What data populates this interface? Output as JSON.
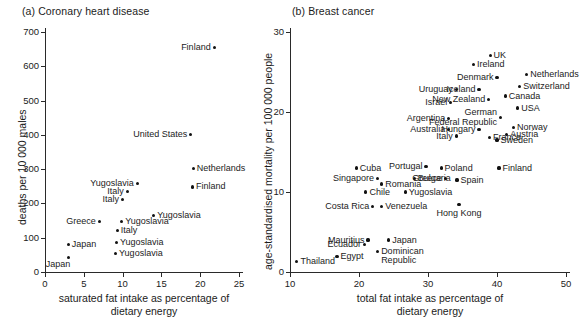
{
  "figure": {
    "panel_a_title": "(a) Coronary heart disease",
    "panel_b_title": "(b) Breast cancer"
  },
  "chart_data": [
    {
      "type": "scatter",
      "title": "(a) Coronary heart disease",
      "xlabel": "saturated fat intake as percentage of\ndietary energy",
      "ylabel": "deaths per 10 000 males",
      "xlim": [
        0,
        25
      ],
      "ylim": [
        0,
        700
      ],
      "xticks": [
        0,
        5,
        10,
        15,
        20,
        25
      ],
      "yticks": [
        0,
        100,
        200,
        300,
        400,
        500,
        600,
        700
      ],
      "grid": false,
      "legend": "none",
      "points": [
        {
          "label": "Finland",
          "x": 21.8,
          "y": 655,
          "lpos": "l"
        },
        {
          "label": "United States",
          "x": 18.8,
          "y": 400,
          "lpos": "l"
        },
        {
          "label": "Netherlands",
          "x": 19.1,
          "y": 302,
          "lpos": "r"
        },
        {
          "label": "Finland",
          "x": 19.0,
          "y": 248,
          "lpos": "r"
        },
        {
          "label": "Yugoslavia",
          "x": 11.9,
          "y": 258,
          "lpos": "l"
        },
        {
          "label": "Italy",
          "x": 10.6,
          "y": 235,
          "lpos": "l"
        },
        {
          "label": "Italy",
          "x": 10.0,
          "y": 211,
          "lpos": "l"
        },
        {
          "label": "Yugoslavia",
          "x": 14.0,
          "y": 165,
          "lpos": "r"
        },
        {
          "label": "Greece",
          "x": 7.0,
          "y": 148,
          "lpos": "l"
        },
        {
          "label": "Yugoslavia",
          "x": 9.9,
          "y": 147,
          "lpos": "r"
        },
        {
          "label": "Italy",
          "x": 9.3,
          "y": 121,
          "lpos": "r"
        },
        {
          "label": "Japan",
          "x": 3.0,
          "y": 80,
          "lpos": "r"
        },
        {
          "label": "Yugoslavia",
          "x": 9.2,
          "y": 87,
          "lpos": "r"
        },
        {
          "label": "Yugoslavia",
          "x": 9.1,
          "y": 55,
          "lpos": "r"
        },
        {
          "label": "Japan",
          "x": 3.0,
          "y": 43,
          "lpos": "bl"
        }
      ]
    },
    {
      "type": "scatter",
      "title": "(b) Breast cancer",
      "xlabel": "total fat intake as percentage of\ndietary energy",
      "ylabel": "age-standardised mortality per 100 000 people",
      "xlim": [
        10,
        50
      ],
      "ylim": [
        0,
        30
      ],
      "xticks": [
        10,
        20,
        30,
        40,
        50
      ],
      "yticks": [
        0,
        10,
        20,
        30
      ],
      "grid": false,
      "legend": "none",
      "points": [
        {
          "label": "UK",
          "x": 39.0,
          "y": 27.1,
          "lpos": "r"
        },
        {
          "label": "Ireland",
          "x": 36.6,
          "y": 25.9,
          "lpos": "r"
        },
        {
          "label": "Netherlands",
          "x": 44.3,
          "y": 24.7,
          "lpos": "r"
        },
        {
          "label": "Denmark",
          "x": 40.0,
          "y": 24.3,
          "lpos": "l"
        },
        {
          "label": "Switzerland",
          "x": 43.3,
          "y": 23.2,
          "lpos": "r"
        },
        {
          "label": "Uruguay",
          "x": 34.1,
          "y": 22.8,
          "lpos": "l"
        },
        {
          "label": "Iceland",
          "x": 37.4,
          "y": 22.8,
          "lpos": "l"
        },
        {
          "label": "Canada",
          "x": 41.2,
          "y": 22.0,
          "lpos": "r"
        },
        {
          "label": "New Zealand",
          "x": 38.8,
          "y": 21.6,
          "lpos": "l"
        },
        {
          "label": "Israel",
          "x": 33.3,
          "y": 21.2,
          "lpos": "l"
        },
        {
          "label": "USA",
          "x": 43.0,
          "y": 20.5,
          "lpos": "r"
        },
        {
          "label": "German\nFederal Republic",
          "x": 40.5,
          "y": 19.3,
          "lpos": "l"
        },
        {
          "label": "Argentina",
          "x": 33.0,
          "y": 19.2,
          "lpos": "l"
        },
        {
          "label": "Norway",
          "x": 42.4,
          "y": 18.1,
          "lpos": "r"
        },
        {
          "label": "Australia",
          "x": 33.0,
          "y": 17.8,
          "lpos": "l"
        },
        {
          "label": "Hungary",
          "x": 37.4,
          "y": 17.8,
          "lpos": "l"
        },
        {
          "label": "Austria",
          "x": 41.4,
          "y": 17.2,
          "lpos": "r"
        },
        {
          "label": "Italy",
          "x": 34.1,
          "y": 17.0,
          "lpos": "l"
        },
        {
          "label": "France",
          "x": 38.9,
          "y": 16.8,
          "lpos": "r"
        },
        {
          "label": "Sweden",
          "x": 40.0,
          "y": 16.5,
          "lpos": "r"
        },
        {
          "label": "Cuba",
          "x": 19.6,
          "y": 13.0,
          "lpos": "r"
        },
        {
          "label": "Portugal",
          "x": 29.7,
          "y": 13.2,
          "lpos": "l"
        },
        {
          "label": "Poland",
          "x": 31.9,
          "y": 13.0,
          "lpos": "r"
        },
        {
          "label": "Finland",
          "x": 40.3,
          "y": 13.0,
          "lpos": "r"
        },
        {
          "label": "Singapore",
          "x": 22.7,
          "y": 11.7,
          "lpos": "l"
        },
        {
          "label": "Bulgaria",
          "x": 28.0,
          "y": 11.7,
          "lpos": "r"
        },
        {
          "label": "Greece",
          "x": 32.5,
          "y": 11.7,
          "lpos": "l"
        },
        {
          "label": "Spain",
          "x": 34.2,
          "y": 11.5,
          "lpos": "r"
        },
        {
          "label": "Romania",
          "x": 23.3,
          "y": 11.0,
          "lpos": "r"
        },
        {
          "label": "Chile",
          "x": 21.0,
          "y": 10.0,
          "lpos": "r"
        },
        {
          "label": "Yugoslavia",
          "x": 26.7,
          "y": 10.0,
          "lpos": "r"
        },
        {
          "label": "Costa Rica",
          "x": 22.0,
          "y": 8.2,
          "lpos": "l"
        },
        {
          "label": "Venezuela",
          "x": 23.3,
          "y": 8.2,
          "lpos": "r"
        },
        {
          "label": "Hong Kong",
          "x": 34.5,
          "y": 8.4,
          "lpos": "bc"
        },
        {
          "label": "Mauritius",
          "x": 21.3,
          "y": 4.0,
          "lpos": "l"
        },
        {
          "label": "Japan",
          "x": 24.3,
          "y": 4.0,
          "lpos": "r"
        },
        {
          "label": "Ecuador",
          "x": 20.8,
          "y": 3.4,
          "lpos": "l"
        },
        {
          "label": "Dominican Republic",
          "x": 22.7,
          "y": 2.6,
          "lpos": "r"
        },
        {
          "label": "Egypt",
          "x": 16.8,
          "y": 1.9,
          "lpos": "r"
        },
        {
          "label": "Thailand",
          "x": 11.0,
          "y": 1.3,
          "lpos": "r"
        }
      ]
    }
  ]
}
